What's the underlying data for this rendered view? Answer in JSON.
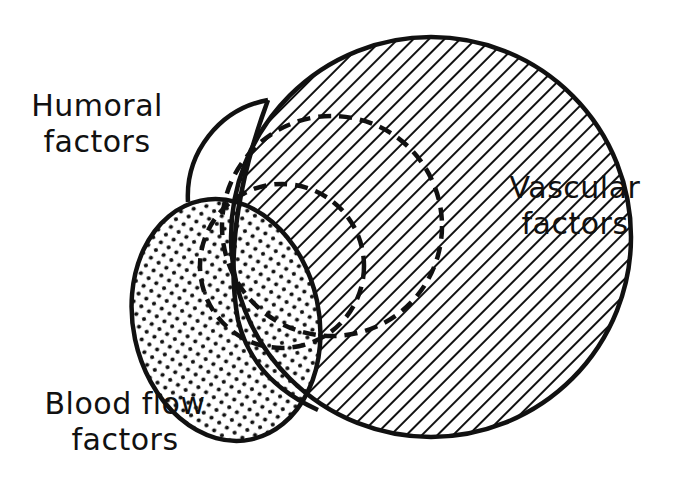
{
  "diagram": {
    "type": "venn",
    "sets": [
      {
        "id": "humoral",
        "label_line1": "Humoral",
        "label_line2": "factors",
        "fill": "none"
      },
      {
        "id": "vascular",
        "label_line1": "Vascular",
        "label_line2": "factors",
        "fill": "diagonal-hatch"
      },
      {
        "id": "blood_flow",
        "label_line1": "Blood flow",
        "label_line2": "factors",
        "fill": "stipple"
      }
    ],
    "inner_regions": [
      {
        "id": "dashed-outer",
        "style": "dashed"
      },
      {
        "id": "dashed-inner",
        "style": "dashed"
      }
    ]
  },
  "colors": {
    "ink": "#111111",
    "background": "#ffffff"
  }
}
